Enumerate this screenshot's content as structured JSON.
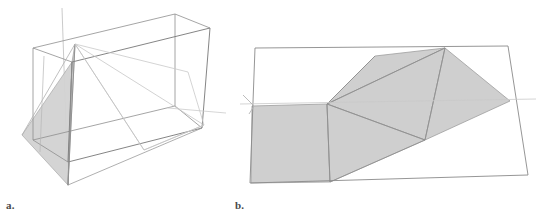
{
  "figure": {
    "caption_a": "a.",
    "caption_b": "b.",
    "title": "",
    "colors": {
      "stroke_dark": "#6f6f6f",
      "stroke_mid": "#9a9a9a",
      "stroke_light": "#c4c4c4",
      "shade_fill": "#cdcdcd",
      "shade_fill_light": "#d6d6d6",
      "background": "#ffffff",
      "label_color": "#4a4a4a"
    },
    "panels": [
      {
        "id": "a",
        "label": "a.",
        "description": "Wireframe rectangular box in oblique projection containing an inscribed folded polygon; one triangular face is shaded grey, plus a faint construction axis line extending beyond the box.",
        "box_vertices": {
          "back_top_left": [
            33,
            48
          ],
          "back_top_right": [
            175,
            14
          ],
          "front_top_right": [
            210,
            28
          ],
          "front_top_left": [
            72,
            62
          ],
          "back_bottom_left": [
            33,
            140
          ],
          "back_bottom_right": [
            175,
            106
          ],
          "front_bottom_right": [
            202,
            128
          ],
          "front_bottom_left": [
            68,
            162
          ]
        },
        "shaded_triangle": [
          [
            72,
            62
          ],
          [
            68,
            185
          ],
          [
            22,
            135
          ]
        ],
        "apex": [
          75,
          44
        ],
        "axis_line": [
          [
            62,
            8
          ],
          [
            68,
            185
          ]
        ],
        "ray_line": [
          [
            75,
            44
          ],
          [
            224,
            112
          ]
        ]
      },
      {
        "id": "b",
        "label": "b.",
        "description": "Flat quadrilateral frame seen in perspective, containing a shaded folded net made of a square and four triangles; a faint horizontal axis with a small arrow head crosses at the left.",
        "quad_vertices": {
          "top_left": [
            255,
            48
          ],
          "top_right": [
            508,
            46
          ],
          "bottom_right": [
            528,
            175
          ],
          "bottom_left": [
            250,
            183
          ]
        },
        "square_region": [
          [
            252,
            106
          ],
          [
            327,
            104
          ],
          [
            330,
            182
          ],
          [
            252,
            183
          ]
        ],
        "fold_vertices": {
          "square_inner_corner": [
            327,
            105
          ],
          "upper_fold": [
            375,
            56
          ],
          "ridge_top": [
            445,
            48
          ],
          "right_tip": [
            510,
            101
          ],
          "lower_fold": [
            425,
            140
          ],
          "bottom_left_fold": [
            330,
            182
          ]
        },
        "axis_line": [
          [
            240,
            104
          ],
          [
            535,
            99
          ]
        ],
        "arrow_head": [
          [
            243,
            96
          ],
          [
            252,
            106
          ],
          [
            248,
            113
          ]
        ]
      }
    ]
  }
}
